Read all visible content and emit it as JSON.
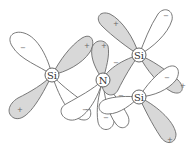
{
  "diagram": {
    "title": "",
    "atoms": [
      {
        "id": "si_left",
        "label": "Si",
        "x": 52,
        "y": 75
      },
      {
        "id": "n",
        "label": "N",
        "x": 103,
        "y": 80
      },
      {
        "id": "si_top_right",
        "label": "Si",
        "x": 139,
        "y": 55
      },
      {
        "id": "si_bottom_right",
        "label": "Si",
        "x": 139,
        "y": 97
      }
    ],
    "lobe_signs": {
      "si_left_upper_left": "−",
      "si_left_upper_right": "+",
      "si_left_lower_left": "+",
      "si_left_lower_right": "−",
      "n_upper_left": "+",
      "n_lower_left": "−",
      "n_lower_right": "−",
      "n_bond_lobe": "+",
      "si_top_right_up": "−",
      "si_top_right_right": "+",
      "si_top_right_lower": "−",
      "si_bottom_right_left": "−",
      "si_bottom_right_right": "−",
      "si_bottom_right_down": "+"
    },
    "colors": {
      "shaded_lobe": "#d8d8d8",
      "white_lobe": "#ffffff",
      "outline": "#6a6a6a"
    }
  }
}
